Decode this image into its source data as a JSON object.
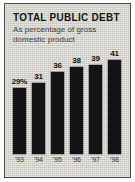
{
  "panel": {
    "background_color": "#d8d7d0",
    "border_color": "#4a4a46"
  },
  "chart_data": {
    "type": "bar",
    "title": "TOTAL PUBLIC DEBT",
    "subtitle": "As percentage of gross domestic product",
    "categories": [
      "'93",
      "'94",
      "'95",
      "'96",
      "'97",
      "'98"
    ],
    "values": [
      29,
      31,
      36,
      38,
      39,
      41
    ],
    "value_labels": [
      "29%",
      "31",
      "36",
      "38",
      "39",
      "41"
    ],
    "xlabel": "",
    "ylabel": "",
    "ylim": [
      0,
      46
    ],
    "grid": false,
    "legend": null,
    "bar_color": "#141416",
    "label_color": "#111113"
  }
}
